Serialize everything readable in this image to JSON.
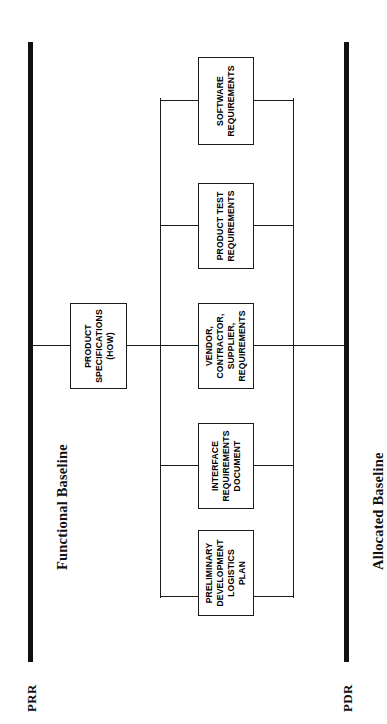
{
  "diagram": {
    "orientation": "rotated-90-ccw",
    "line_color": "#1a1a1a",
    "bar_color": "#111111",
    "background": "#ffffff"
  },
  "baselines": [
    {
      "id": "functional",
      "milestone_label": "PRR",
      "caption": "Functional Baseline"
    },
    {
      "id": "allocated",
      "milestone_label": "PDR",
      "caption": "Allocated Baseline"
    }
  ],
  "nodes": [
    {
      "id": "product-specifications",
      "label": "PRODUCT\nSPECIFICATIONS\n(HOW)",
      "column": "functional"
    },
    {
      "id": "software-requirements",
      "label": "SOFTWARE\nREQUIREMENTS",
      "column": "allocated"
    },
    {
      "id": "product-test-requirements",
      "label": "PRODUCT TEST\nREQUIREMENTS",
      "column": "allocated"
    },
    {
      "id": "vendor-contractor-supplier-requirements",
      "label": "VENDOR,\nCONTRACTOR,\nSUPPLIER,\nREQUIREMENTS",
      "column": "allocated"
    },
    {
      "id": "interface-requirements-document",
      "label": "INTERFACE\nREQUIREMENTS\nDOCUMENT",
      "column": "allocated"
    },
    {
      "id": "preliminary-development-logistics-plan",
      "label": "PRELIMINARY\nDEVELOPMENT\nLOGISTICS\nPLAN",
      "column": "allocated"
    }
  ]
}
